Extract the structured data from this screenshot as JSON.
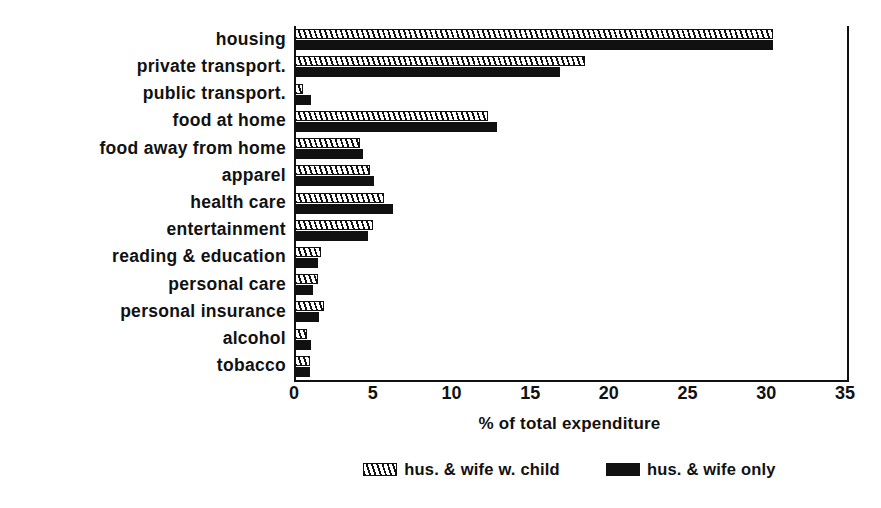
{
  "chart_data": {
    "type": "bar",
    "orientation": "horizontal",
    "title": "",
    "xlabel": "% of total expenditure",
    "ylabel": "",
    "xlim": [
      0,
      35
    ],
    "xticks": [
      0,
      5,
      10,
      15,
      20,
      25,
      30,
      35
    ],
    "grid": false,
    "legend_position": "bottom-center",
    "categories": [
      "housing",
      "private transport.",
      "public transport.",
      "food at home",
      "food away from home",
      "apparel",
      "health care",
      "entertainment",
      "reading & education",
      "personal care",
      "personal insurance",
      "alcohol",
      "tobacco"
    ],
    "series": [
      {
        "name": "hus. & wife w. child",
        "pattern": "hatch",
        "color": "#111111",
        "values": [
          30.4,
          18.5,
          0.6,
          12.3,
          4.2,
          4.8,
          5.7,
          5.0,
          1.7,
          1.5,
          1.9,
          0.8,
          1.0
        ]
      },
      {
        "name": "hus. & wife only",
        "pattern": "solid",
        "color": "#111111",
        "values": [
          30.4,
          16.9,
          1.1,
          12.9,
          4.4,
          5.1,
          6.3,
          4.7,
          1.5,
          1.2,
          1.6,
          1.1,
          1.0
        ]
      }
    ],
    "legend": [
      {
        "label": "hus. & wife w. child",
        "pattern": "hatch"
      },
      {
        "label": "hus. & wife only",
        "pattern": "solid"
      }
    ],
    "tick_labels": [
      "0",
      "5",
      "10",
      "15",
      "20",
      "25",
      "30",
      "35"
    ]
  }
}
